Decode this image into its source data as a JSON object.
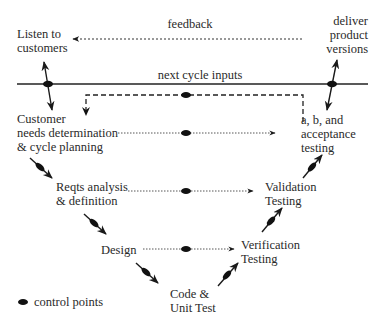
{
  "diagram": {
    "type": "V-model software development cycle",
    "nodes": {
      "listen": [
        "Listen to",
        "customers"
      ],
      "deliver": [
        "deliver",
        "product",
        "versions"
      ],
      "customer": [
        "Customer",
        "needs determination",
        "& cycle planning"
      ],
      "reqts": [
        "Reqts analysis",
        "& definition"
      ],
      "design": [
        "Design"
      ],
      "code": [
        "Code &",
        "Unit Test"
      ],
      "verification": [
        "Verification",
        "Testing"
      ],
      "validation": [
        "Validation",
        "Testing"
      ],
      "acceptance": [
        "a, b, and",
        "acceptance",
        "testing"
      ]
    },
    "edges": {
      "feedback": "feedback",
      "next_cycle": "next cycle inputs"
    },
    "legend": {
      "control_points": "control points"
    },
    "colors": {
      "ink": "#222222",
      "background": "#ffffff"
    }
  }
}
